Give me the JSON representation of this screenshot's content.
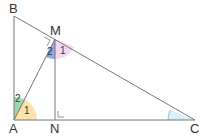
{
  "diagram": {
    "points": {
      "A": {
        "label": "A",
        "x": 14,
        "y": 120
      },
      "B": {
        "label": "B",
        "x": 14,
        "y": 16
      },
      "C": {
        "label": "C",
        "x": 195,
        "y": 120
      },
      "M": {
        "label": "M",
        "x": 55,
        "y": 39
      },
      "N": {
        "label": "N",
        "x": 55,
        "y": 120
      }
    },
    "angles": {
      "A1": {
        "label": "1",
        "color": "#fde3a7"
      },
      "A2": {
        "label": "2",
        "color": "#9fd9b4"
      },
      "M1": {
        "label": "1",
        "color": "#f6d6ef"
      },
      "M2": {
        "label": "2",
        "color": "#8fa8e0"
      },
      "C": {
        "label": "",
        "color": "#d8f1f6"
      }
    },
    "line_color": "#777777"
  }
}
